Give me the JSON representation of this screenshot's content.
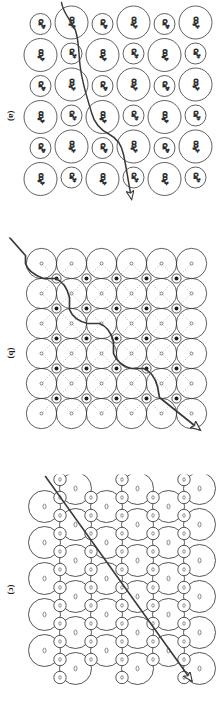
{
  "figure": {
    "kind": "scientific-figure",
    "orientation_deg": 90,
    "background_color": "#ffffff",
    "line_color": "#2b2b2b",
    "crack_color": "#3a3a3a",
    "panel_count": 3
  },
  "panels": [
    {
      "id": "a",
      "label": "(a)",
      "lattice_type": "checkerboard-ionic",
      "rows": 6,
      "cols": 6,
      "large_ion_label": "CO3 2-",
      "large_ion_text": "CO",
      "large_ion_sub": "3",
      "large_ion_sup": "2-",
      "small_ion_label": "Ca 2+",
      "small_ion_text": "Ca",
      "small_ion_sup": "2+",
      "crack_path": "stepped",
      "arrow": "crack-propagation-arrow",
      "has_dashed_bonds": false
    },
    {
      "id": "b",
      "label": "(b)",
      "lattice_type": "square-close-packed",
      "rows": 6,
      "cols": 6,
      "large_ion_label": "anion",
      "small_ion_label": "cation",
      "crack_path": "stepped",
      "arrow": "crack-propagation-arrow",
      "has_dashed_bonds": true
    },
    {
      "id": "c",
      "label": "(c)",
      "lattice_type": "hexagonal-close-packed",
      "rows": 6,
      "cols": 5,
      "large_ion_label": "anion",
      "small_ion_label": "cation",
      "crack_path": "straight-cleavage",
      "arrow": "cleavage-direction-arrow",
      "has_dashed_bonds": false
    }
  ],
  "colors": {
    "stroke": "#2b2b2b",
    "crack": "#3a3a3a",
    "cation_fill": "#1c1c1c",
    "dashed_bond": "#8c8c8c"
  }
}
